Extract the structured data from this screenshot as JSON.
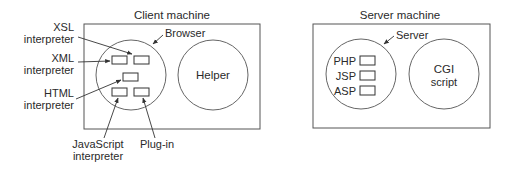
{
  "client": {
    "title": "Client machine",
    "browser": {
      "label": "Browser",
      "components": [
        {
          "id": "xsl",
          "label_line1": "XSL",
          "label_line2": "interpreter"
        },
        {
          "id": "xml",
          "label_line1": "XML",
          "label_line2": "interpreter"
        },
        {
          "id": "html",
          "label_line1": "HTML",
          "label_line2": "interpreter"
        },
        {
          "id": "javascript",
          "label_line1": "JavaScript",
          "label_line2": "interpreter"
        },
        {
          "id": "plugin",
          "label_line1": "Plug-in",
          "label_line2": ""
        }
      ]
    },
    "helper": {
      "label": "Helper"
    }
  },
  "server": {
    "title": "Server machine",
    "server_process": {
      "label": "Server",
      "components": [
        {
          "id": "php",
          "label": "PHP"
        },
        {
          "id": "jsp",
          "label": "JSP"
        },
        {
          "id": "asp",
          "label": "ASP"
        }
      ]
    },
    "cgi": {
      "label_line1": "CGI",
      "label_line2": "script"
    }
  }
}
